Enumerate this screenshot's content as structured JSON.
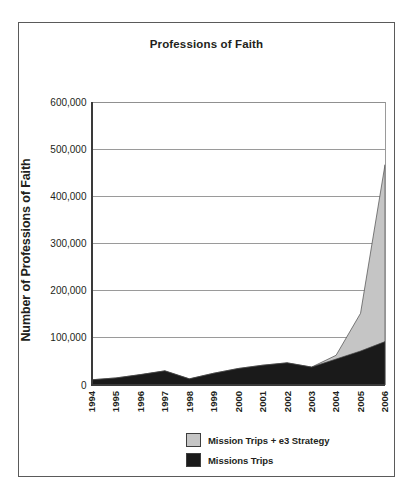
{
  "chart_data": {
    "type": "area",
    "title": "Professions of Faith",
    "xlabel": "",
    "ylabel": "Number of Professions of Faith",
    "stacked": true,
    "grid": true,
    "legend_position": "bottom-right",
    "categories": [
      "1994",
      "1995",
      "1996",
      "1997",
      "1998",
      "1999",
      "2000",
      "2001",
      "2002",
      "2003",
      "2004",
      "2005",
      "2006"
    ],
    "x": [
      1994,
      1995,
      1996,
      1997,
      1998,
      1999,
      2000,
      2001,
      2002,
      2003,
      2004,
      2005,
      2006
    ],
    "ylim": [
      0,
      600000
    ],
    "ytick_values": [
      0,
      100000,
      200000,
      300000,
      400000,
      500000,
      600000
    ],
    "ytick_labels": [
      "0",
      "100,000",
      "200,000",
      "300,000",
      "400,000",
      "500,000",
      "600,000"
    ],
    "series": [
      {
        "name": "Missions Trips",
        "color": "#1a1a1a",
        "values": [
          11000,
          15000,
          22000,
          30000,
          13000,
          25000,
          35000,
          42000,
          47000,
          38000,
          55000,
          72000,
          92000
        ]
      },
      {
        "name": "Mission Trips + e3 Strategy",
        "color": "#c5c5c5",
        "values": [
          0,
          0,
          0,
          0,
          0,
          0,
          0,
          0,
          0,
          0,
          8000,
          80000,
          375000
        ]
      }
    ],
    "series_totals": [
      11000,
      15000,
      22000,
      30000,
      13000,
      25000,
      35000,
      42000,
      47000,
      38000,
      63000,
      152000,
      467000
    ]
  },
  "legend": {
    "items": [
      {
        "label": "Mission Trips + e3 Strategy",
        "color": "#c5c5c5"
      },
      {
        "label": "Missions Trips",
        "color": "#1a1a1a"
      }
    ]
  }
}
